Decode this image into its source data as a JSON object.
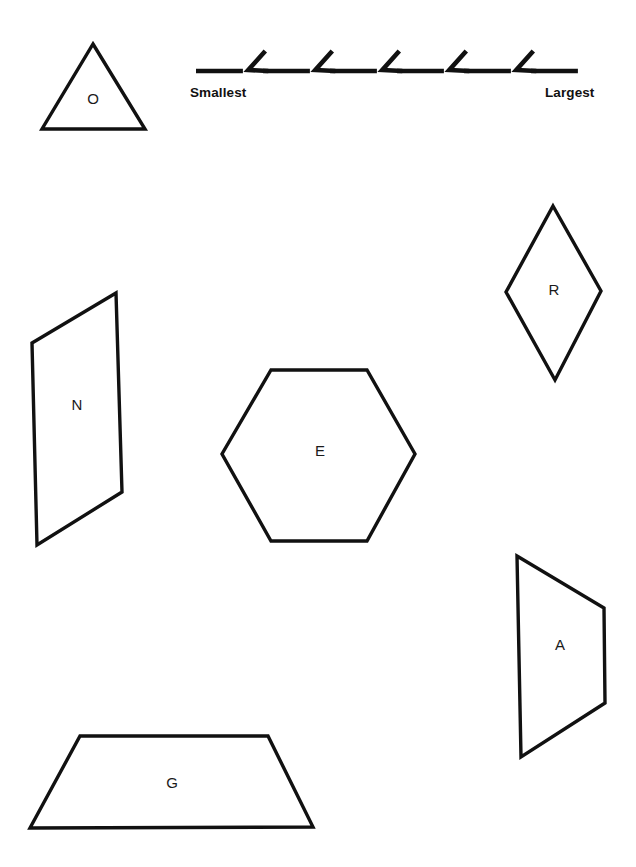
{
  "page": {
    "background_color": "#ffffff",
    "ink_color": "#111111",
    "width": 636,
    "height": 867
  },
  "size_scale": {
    "smallest_label": "Smallest",
    "largest_label": "Largest",
    "chevron_count": 5,
    "segment_count": 6,
    "direction": "left-to-right increasing",
    "baseline_y": 71,
    "start_x": 196,
    "end_x": 598
  },
  "shapes": [
    {
      "letter": "O",
      "name": "triangle",
      "sides": 3,
      "label_x": 93,
      "label_y": 100,
      "points": "93,44 145,129 42,129"
    },
    {
      "letter": "N",
      "name": "parallelogram",
      "sides": 4,
      "label_x": 77,
      "label_y": 406,
      "points": "116,293 122,492 37,545 32,343"
    },
    {
      "letter": "E",
      "name": "hexagon",
      "sides": 6,
      "label_x": 320,
      "label_y": 452,
      "points": "271,370 367,370 415,454 367,541 271,541 222,454"
    },
    {
      "letter": "R",
      "name": "rhombus",
      "sides": 4,
      "label_x": 554,
      "label_y": 291,
      "points": "553,206 601,291 555,380 506,292"
    },
    {
      "letter": "A",
      "name": "trapezoid-right",
      "sides": 4,
      "label_x": 560,
      "label_y": 646,
      "points": "517,556 604,608 605,703 521,757"
    },
    {
      "letter": "G",
      "name": "trapezoid-bottom",
      "sides": 4,
      "label_x": 172,
      "label_y": 784,
      "points": "80,736 268,736 313,827 30,828"
    }
  ]
}
